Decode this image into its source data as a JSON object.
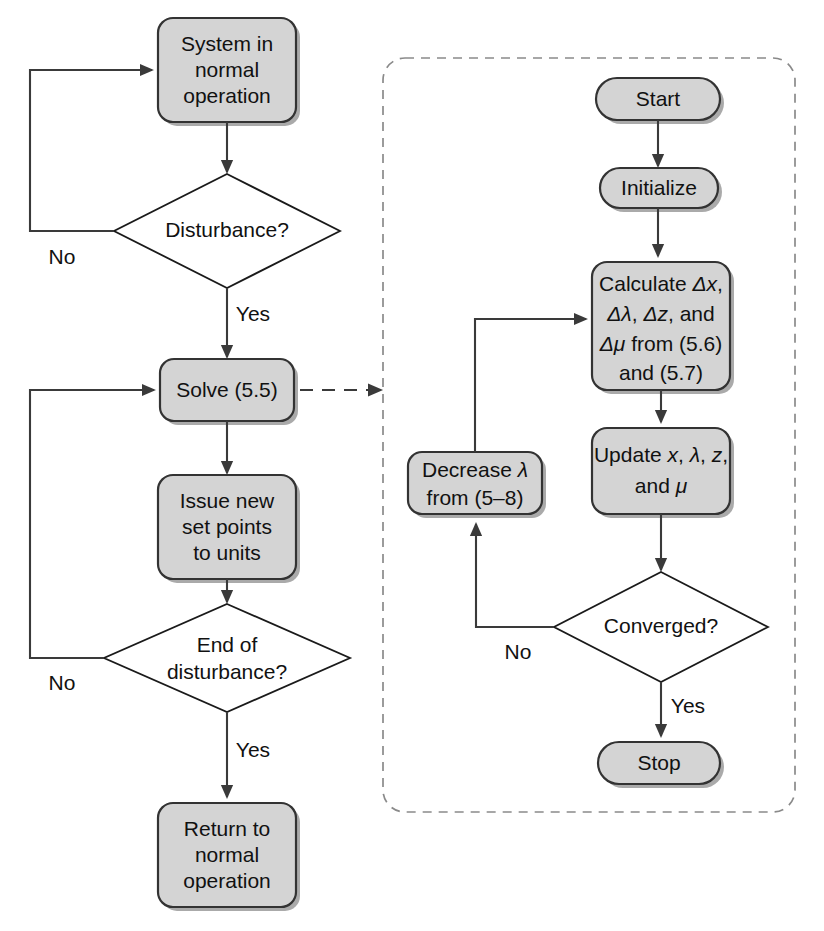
{
  "diagram": {
    "type": "flowchart",
    "title": "",
    "palette": {
      "node_fill": "#d4d4d4",
      "node_stroke": "#333333",
      "decision_fill": "#ffffff",
      "connector": "#3a3a3a",
      "group_border": "#8a8a8a",
      "background": "#ffffff"
    },
    "outer_process": {
      "name": "outer-control-loop",
      "nodes": [
        {
          "id": "system-normal",
          "shape": "rounded-rect",
          "lines": [
            "System in",
            "normal",
            "operation"
          ]
        },
        {
          "id": "disturbance",
          "shape": "diamond",
          "lines": [
            "Disturbance?"
          ]
        },
        {
          "id": "solve",
          "shape": "rounded-rect",
          "lines": [
            "Solve (5.5)"
          ]
        },
        {
          "id": "issue-set-points",
          "shape": "rounded-rect",
          "lines": [
            "Issue new",
            "set points",
            "to units"
          ]
        },
        {
          "id": "end-of-disturbance",
          "shape": "diamond",
          "lines": [
            "End of",
            "disturbance?"
          ]
        },
        {
          "id": "return-normal",
          "shape": "rounded-rect",
          "lines": [
            "Return to",
            "normal",
            "operation"
          ]
        }
      ],
      "edge_labels": {
        "disturbance_no": "No",
        "disturbance_yes": "Yes",
        "end_disturbance_no": "No",
        "end_disturbance_yes": "Yes"
      }
    },
    "inner_process": {
      "name": "interior-point-solver-detail",
      "boxed": true,
      "nodes": [
        {
          "id": "start",
          "shape": "stadium",
          "lines": [
            "Start"
          ]
        },
        {
          "id": "initialize",
          "shape": "stadium",
          "lines": [
            "Initialize"
          ]
        },
        {
          "id": "calculate",
          "shape": "rounded-rect",
          "lines": [
            "Calculate Δx,",
            "Δλ, Δz, and",
            "Δμ from (5.6)",
            "and (5.7)"
          ]
        },
        {
          "id": "update",
          "shape": "rounded-rect",
          "lines": [
            "Update x, λ, z,",
            "and μ"
          ]
        },
        {
          "id": "converged",
          "shape": "diamond",
          "lines": [
            "Converged?"
          ]
        },
        {
          "id": "decrease-lambda",
          "shape": "rounded-rect",
          "lines": [
            "Decrease λ",
            "from (5–8)"
          ]
        },
        {
          "id": "stop",
          "shape": "stadium",
          "lines": [
            "Stop"
          ]
        }
      ],
      "edge_labels": {
        "converged_no": "No",
        "converged_yes": "Yes"
      }
    },
    "text": {
      "system_l1": "System in",
      "system_l2": "normal",
      "system_l3": "operation",
      "disturbance": "Disturbance?",
      "solve": "Solve (5.5)",
      "issue_l1": "Issue new",
      "issue_l2": "set points",
      "issue_l3": "to units",
      "end_l1": "End of",
      "end_l2": "disturbance?",
      "return_l1": "Return to",
      "return_l2": "normal",
      "return_l3": "operation",
      "no_1": "No",
      "yes_1": "Yes",
      "no_2": "No",
      "yes_2": "Yes",
      "start": "Start",
      "initialize": "Initialize",
      "calc_l1_a": "Calculate ",
      "calc_l1_b": "Δx",
      "calc_l1_c": ",",
      "calc_l2_a": "Δλ",
      "calc_l2_b": ", ",
      "calc_l2_c": "Δz",
      "calc_l2_d": ", and",
      "calc_l3_a": "Δμ",
      "calc_l3_b": " from (5.6)",
      "calc_l4": "and (5.7)",
      "upd_l1_a": "Update ",
      "upd_l1_b": "x",
      "upd_l1_c": ", ",
      "upd_l1_d": "λ",
      "upd_l1_e": ", ",
      "upd_l1_f": "z",
      "upd_l1_g": ",",
      "upd_l2_a": "and ",
      "upd_l2_b": "μ",
      "dec_l1_a": "Decrease ",
      "dec_l1_b": "λ",
      "dec_l2": "from (5–8)",
      "converged": "Converged?",
      "no_3": "No",
      "yes_3": "Yes",
      "stop": "Stop"
    }
  }
}
